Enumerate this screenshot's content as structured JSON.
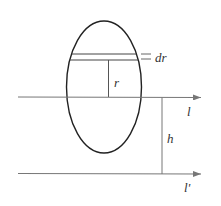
{
  "diagram": {
    "labels": {
      "dr": "dr",
      "r": "r",
      "l": "l",
      "h": "h",
      "l_prime": "l'"
    },
    "colors": {
      "ellipse": "#222222",
      "lines": "#777777",
      "background": "#ffffff"
    }
  }
}
